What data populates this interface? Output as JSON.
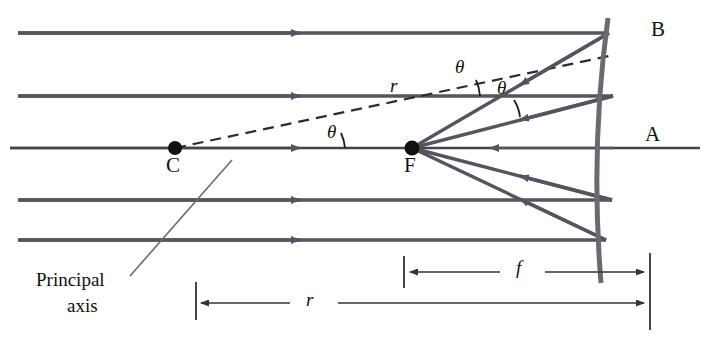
{
  "figure": {
    "background_color": "#ffffff",
    "ray_color": "#555560",
    "axis_color": "#44444c",
    "dim_color": "#333338",
    "text_color": "#111111",
    "width": 705,
    "height": 350
  },
  "labels": {
    "center_of_curvature": "C",
    "focal_point": "F",
    "mirror_vertex": "A",
    "mirror_edge": "B",
    "principal_axis_line1": "Principal",
    "principal_axis_line2": "axis",
    "theta_1": "θ",
    "theta_2": "θ",
    "theta_3": "θ",
    "radius_ray": "r",
    "focal_length_dim": "f",
    "radius_dim": "r"
  },
  "optics_data": {
    "type": "ray-diagram",
    "element": "concave spherical mirror",
    "incoming_rays": 5,
    "incoming_ray_direction": "left-to-right, parallel to principal axis",
    "reflected_ray_direction": "right-to-left, converging to focal point",
    "points": [
      {
        "name": "C",
        "role": "center of curvature",
        "x": 175,
        "y": 148
      },
      {
        "name": "F",
        "role": "focal point",
        "x": 412,
        "y": 148
      },
      {
        "name": "A",
        "role": "mirror vertex on axis",
        "x": 614,
        "y": 148
      },
      {
        "name": "B",
        "role": "upper mirror edge",
        "x": 617,
        "y": 30
      }
    ],
    "ray_heights_y": [
      33,
      96,
      148,
      200,
      240
    ],
    "angles_marked": 3,
    "angle_symbol": "θ",
    "dimensions": [
      {
        "label": "f",
        "meaning": "focal length",
        "from": "F",
        "to": "A"
      },
      {
        "label": "r",
        "meaning": "radius of curvature",
        "from": "C",
        "to": "A"
      }
    ],
    "relation": "r = 2f"
  }
}
